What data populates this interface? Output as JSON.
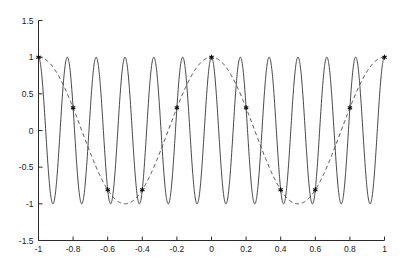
{
  "figure": {
    "width": 404,
    "height": 266,
    "background_color": "#ffffff",
    "axes_color": "#2a2a2a"
  },
  "chart_data": {
    "type": "line",
    "title": "",
    "subtitle": "",
    "xlabel": "",
    "ylabel": "",
    "xlim": [
      -1,
      1
    ],
    "ylim": [
      -1.5,
      1.5
    ],
    "grid": false,
    "legend": null,
    "legend_position": "none",
    "xticks": [
      -1,
      -0.8,
      -0.6,
      -0.4,
      -0.2,
      0,
      0.2,
      0.4,
      0.6,
      0.8,
      1
    ],
    "xticklabels": [
      "-1",
      "-0.8",
      "-0.6",
      "-0.4",
      "-0.2",
      "0",
      "0.2",
      "0.4",
      "0.6",
      "0.8",
      "1"
    ],
    "yticks": [
      -1.5,
      -1,
      -0.5,
      0,
      0.5,
      1,
      1.5
    ],
    "yticklabels": [
      "-1.5",
      "-1",
      "-0.5",
      "0",
      "0.5",
      "1",
      "1.5"
    ],
    "series": [
      {
        "name": "high-frequency-cosine",
        "style": "solid",
        "color": "#303030",
        "linewidth": 0.9,
        "marker": "none",
        "formula": "cos(12*pi*x)",
        "frequency_cycles_per_unit": 6,
        "amplitude": 1,
        "cycles_in_view": 12,
        "x_start": -1,
        "x_end": 1,
        "samples": 2000
      },
      {
        "name": "low-frequency-alias-cosine",
        "style": "dashed",
        "color": "#3a3a3a",
        "linewidth": 0.9,
        "marker": "none",
        "formula": "cos(2*pi*x)",
        "frequency_cycles_per_unit": 1,
        "amplitude": 1,
        "cycles_in_view": 2,
        "x_start": -1,
        "x_end": 1,
        "samples": 800
      },
      {
        "name": "sample-points",
        "style": "markers",
        "color": "#101010",
        "marker": "asterisk",
        "marker_size": 5,
        "x": [
          -1,
          -0.8,
          -0.6,
          -0.4,
          -0.2,
          0,
          0.2,
          0.4,
          0.6,
          0.8,
          1
        ],
        "y": [
          1,
          0.309,
          -0.809,
          -0.809,
          0.309,
          1,
          0.309,
          -0.809,
          -0.809,
          0.309,
          1
        ]
      }
    ]
  }
}
